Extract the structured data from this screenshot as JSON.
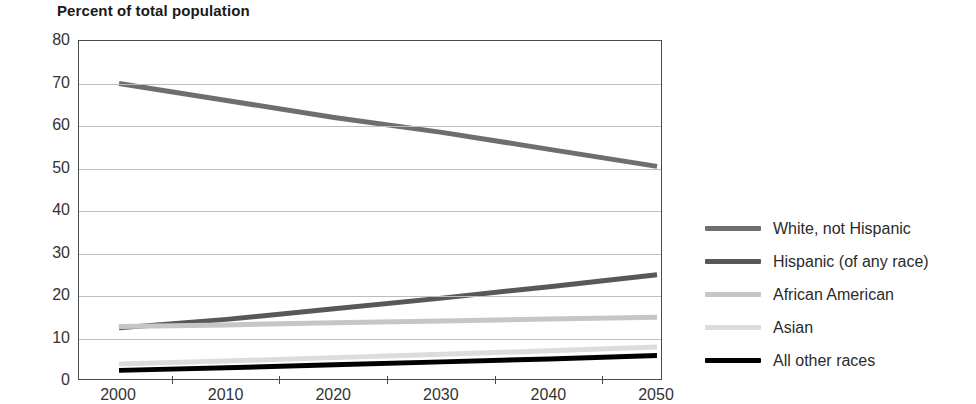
{
  "chart_data": {
    "type": "line",
    "title": "Percent of total population",
    "xlabel": "",
    "ylabel": "",
    "xlim": [
      2000,
      2050
    ],
    "ylim": [
      0,
      80
    ],
    "ytick_step": 10,
    "grid": true,
    "legend_position": "right",
    "x": [
      2000,
      2010,
      2020,
      2030,
      2040,
      2050
    ],
    "xticks": [
      "2000",
      "2010",
      "2020",
      "2030",
      "2040",
      "2050"
    ],
    "yticks": [
      "0",
      "10",
      "20",
      "30",
      "40",
      "50",
      "60",
      "70",
      "80"
    ],
    "series": [
      {
        "name": "White, not Hispanic",
        "color": "#6e6e6e",
        "width": 5,
        "values": [
          70,
          66,
          62,
          58.5,
          54.5,
          50.5
        ]
      },
      {
        "name": "Hispanic (of any race)",
        "color": "#585858",
        "width": 5,
        "values": [
          12.5,
          14.5,
          17,
          19.5,
          22.2,
          25
        ]
      },
      {
        "name": "African American",
        "color": "#c6c6c6",
        "width": 5,
        "values": [
          12.8,
          13.2,
          13.7,
          14.1,
          14.6,
          15
        ]
      },
      {
        "name": "Asian",
        "color": "#dcdcdc",
        "width": 5,
        "values": [
          4,
          4.7,
          5.5,
          6.3,
          7.1,
          8
        ]
      },
      {
        "name": "All other races",
        "color": "#000000",
        "width": 5,
        "values": [
          2.5,
          3.1,
          3.8,
          4.5,
          5.2,
          6
        ]
      }
    ]
  }
}
